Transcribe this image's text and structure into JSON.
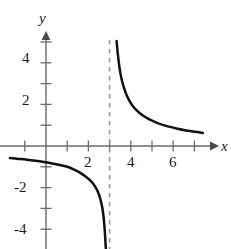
{
  "figure": {
    "width": 231,
    "height": 249,
    "background": "#ffffff"
  },
  "chart_data": {
    "type": "line",
    "title": "",
    "xlabel": "x",
    "ylabel": "y",
    "xlim": [
      -2.2,
      8.3
    ],
    "ylim": [
      -5.0,
      5.6
    ],
    "grid": false,
    "legend": null,
    "axis_color": "#6b6b6b",
    "curve_color": "#111111",
    "asymptote_color": "#9a9a9a",
    "xticks": [
      -1,
      1,
      2,
      3,
      4,
      5,
      6,
      7
    ],
    "xtick_labels_shown": [
      "2",
      "4",
      "6"
    ],
    "xtick_labels_shown_values": [
      2,
      4,
      6
    ],
    "yticks": [
      -4,
      -3,
      -2,
      -1,
      1,
      2,
      3,
      4,
      5
    ],
    "ytick_labels_shown": [
      "4",
      "2",
      "-2",
      "-4"
    ],
    "ytick_labels_shown_values": [
      4,
      2,
      -2,
      -4
    ],
    "annotations": [
      {
        "name": "vertical-asymptote",
        "type": "vline",
        "x": 3,
        "style": "dashed",
        "y_from": -5.0,
        "y_to": 5.1
      }
    ],
    "series": [
      {
        "name": "left-branch",
        "style": "solid",
        "points": [
          [
            -1.7,
            -0.58
          ],
          [
            -1.3,
            -0.62
          ],
          [
            -0.9,
            -0.66
          ],
          [
            -0.5,
            -0.71
          ],
          [
            -0.1,
            -0.77
          ],
          [
            0.3,
            -0.84
          ],
          [
            0.7,
            -0.93
          ],
          [
            1.0,
            -1.0
          ],
          [
            1.3,
            -1.12
          ],
          [
            1.6,
            -1.28
          ],
          [
            1.85,
            -1.45
          ],
          [
            2.05,
            -1.62
          ],
          [
            2.25,
            -1.85
          ],
          [
            2.4,
            -2.1
          ],
          [
            2.52,
            -2.4
          ],
          [
            2.6,
            -2.7
          ],
          [
            2.67,
            -3.05
          ],
          [
            2.72,
            -3.45
          ],
          [
            2.76,
            -3.9
          ],
          [
            2.79,
            -4.35
          ],
          [
            2.81,
            -4.75
          ],
          [
            2.83,
            -5.0
          ]
        ]
      },
      {
        "name": "right-branch",
        "style": "solid",
        "points": [
          [
            3.33,
            5.05
          ],
          [
            3.38,
            4.5
          ],
          [
            3.43,
            4.05
          ],
          [
            3.5,
            3.55
          ],
          [
            3.58,
            3.15
          ],
          [
            3.68,
            2.8
          ],
          [
            3.8,
            2.45
          ],
          [
            3.95,
            2.15
          ],
          [
            4.15,
            1.85
          ],
          [
            4.4,
            1.6
          ],
          [
            4.7,
            1.38
          ],
          [
            5.0,
            1.22
          ],
          [
            5.4,
            1.05
          ],
          [
            5.8,
            0.93
          ],
          [
            6.2,
            0.83
          ],
          [
            6.6,
            0.75
          ],
          [
            7.0,
            0.69
          ],
          [
            7.4,
            0.63
          ]
        ]
      }
    ]
  },
  "labels": {
    "y_axis": "y",
    "x_axis": "x",
    "y_4": "4",
    "y_2": "2",
    "y_neg2": "-2",
    "y_neg4": "-4",
    "x_2": "2",
    "x_4": "4",
    "x_6": "6"
  }
}
